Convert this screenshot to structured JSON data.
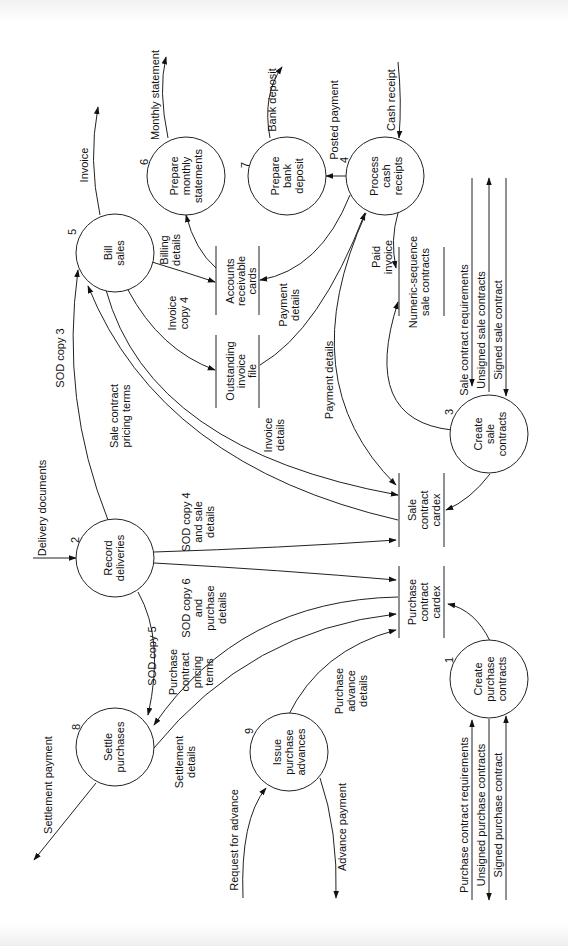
{
  "diagram": {
    "type": "data-flow-diagram",
    "orientation": "rotated-90-ccw",
    "processes": [
      {
        "id": "1",
        "number": "1",
        "lines": [
          "Create",
          "purchase",
          "contracts"
        ]
      },
      {
        "id": "2",
        "number": "2",
        "lines": [
          "Record",
          "deliveries"
        ]
      },
      {
        "id": "3",
        "number": "3",
        "lines": [
          "Create",
          "sale",
          "contracts"
        ]
      },
      {
        "id": "4",
        "number": "4",
        "lines": [
          "Process",
          "cash",
          "receipts"
        ]
      },
      {
        "id": "5",
        "number": "5",
        "lines": [
          "Bill",
          "sales"
        ]
      },
      {
        "id": "6",
        "number": "6",
        "lines": [
          "Prepare",
          "monthly",
          "statements"
        ]
      },
      {
        "id": "7",
        "number": "7",
        "lines": [
          "Prepare",
          "bank",
          "deposit"
        ]
      },
      {
        "id": "8",
        "number": "8",
        "lines": [
          "Settle",
          "purchases"
        ]
      },
      {
        "id": "9",
        "number": "9",
        "lines": [
          "Issue",
          "purchase",
          "advances"
        ]
      }
    ],
    "data_stores": [
      {
        "id": "ar",
        "lines": [
          "Accounts",
          "receivable",
          "cards"
        ]
      },
      {
        "id": "oi",
        "lines": [
          "Outstanding",
          "invoice",
          "file"
        ]
      },
      {
        "id": "ns",
        "lines": [
          "Numeric-sequence",
          "sale contracts"
        ]
      },
      {
        "id": "sc",
        "lines": [
          "Sale",
          "contract",
          "cardex"
        ]
      },
      {
        "id": "pc",
        "lines": [
          "Purchase",
          "contract",
          "cardex"
        ]
      }
    ],
    "flows": {
      "invoice": [
        "Invoice"
      ],
      "monthly_statement": [
        "Monthly statement"
      ],
      "bank_deposit": [
        "Bank deposit"
      ],
      "posted_payment": [
        "Posted payment"
      ],
      "cash_receipt": [
        "Cash receipt"
      ],
      "billing_details": [
        "Billing",
        "details"
      ],
      "invoice_copy4": [
        "Invoice",
        "copy 4"
      ],
      "payment_details_ar": [
        "Payment",
        "details"
      ],
      "paid_invoice": [
        "Paid",
        "invoice"
      ],
      "sod_copy3": [
        "SOD copy 3"
      ],
      "sale_pricing": [
        "Sale contract",
        "pricing terms"
      ],
      "invoice_details": [
        "Invoice",
        "details"
      ],
      "payment_details_sc": [
        "Payment details"
      ],
      "delivery_documents": [
        "Delivery documents"
      ],
      "sod4": [
        "SOD copy 4",
        "and sale",
        "details"
      ],
      "sod6": [
        "SOD copy 6",
        "and",
        "purchase",
        "details"
      ],
      "sod5": [
        "SOD copy 5"
      ],
      "purchase_pricing": [
        "Purchase",
        "contract",
        "pricing",
        "terms"
      ],
      "settlement_details": [
        "Settlement",
        "details"
      ],
      "settlement_payment": [
        "Settlement payment"
      ],
      "purchase_advance_details": [
        "Purchase",
        "advance",
        "details"
      ],
      "request_for_advance": [
        "Request for advance"
      ],
      "advance_payment": [
        "Advance payment"
      ],
      "sale_req": [
        "Sale contract requirements"
      ],
      "unsigned_sale": [
        "Unsigned sale contracts"
      ],
      "signed_sale": [
        "Signed sale contract"
      ],
      "purchase_req": [
        "Purchase contract requirements"
      ],
      "unsigned_purchase": [
        "Unsigned purchase contracts"
      ],
      "signed_purchase": [
        "Signed purchase contract"
      ]
    }
  }
}
